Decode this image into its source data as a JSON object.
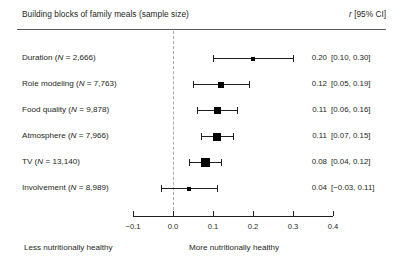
{
  "header": {
    "left_title": "Building blocks of family meals (sample size)",
    "right_title_stat": "r",
    "right_title_ci": " [95% CI]"
  },
  "chart_data": {
    "type": "forest",
    "title": "Building blocks of family meals (sample size)",
    "xlabel": "",
    "ylabel": "",
    "xlim": [
      -0.1,
      0.4
    ],
    "xticks": [
      "-0.1",
      "0.0",
      "0.1",
      "0.2",
      "0.3",
      "0.4"
    ],
    "xtick_values": [
      -0.1,
      0.0,
      0.1,
      0.2,
      0.3,
      0.4
    ],
    "grid": false,
    "reference_line": 0.0,
    "effect_measure": "r",
    "rows": [
      {
        "label_name": "Duration",
        "label_n": "2,666",
        "label": "Duration (N = 2,666)",
        "estimate": 0.2,
        "ci_low": 0.1,
        "ci_high": 0.3,
        "estimate_text": "0.20",
        "ci_text": "[0.10, 0.30]",
        "n": 2666,
        "marker_size": 4
      },
      {
        "label_name": "Role modeling",
        "label_n": "7,763",
        "label": "Role modeling (N = 7,763)",
        "estimate": 0.12,
        "ci_low": 0.05,
        "ci_high": 0.19,
        "estimate_text": "0.12",
        "ci_text": "[0.05, 0.19]",
        "n": 7763,
        "marker_size": 6
      },
      {
        "label_name": "Food quality",
        "label_n": "9,878",
        "label": "Food quality (N = 9,878)",
        "estimate": 0.11,
        "ci_low": 0.06,
        "ci_high": 0.16,
        "estimate_text": "0.11",
        "ci_text": "[0.06, 0.16]",
        "n": 9878,
        "marker_size": 7
      },
      {
        "label_name": "Atmosphere",
        "label_n": "7,966",
        "label": "Atmosphere (N = 7,966)",
        "estimate": 0.11,
        "ci_low": 0.07,
        "ci_high": 0.15,
        "estimate_text": "0.11",
        "ci_text": "[0.07, 0.15]",
        "n": 7966,
        "marker_size": 8
      },
      {
        "label_name": "TV",
        "label_n": "13,140",
        "label": "TV (N = 13,140)",
        "estimate": 0.08,
        "ci_low": 0.04,
        "ci_high": 0.12,
        "estimate_text": "0.08",
        "ci_text": "[0.04, 0.12]",
        "n": 13140,
        "marker_size": 9
      },
      {
        "label_name": "Involvement",
        "label_n": "8,989",
        "label": "Involvement (N = 8,989)",
        "estimate": 0.04,
        "ci_low": -0.03,
        "ci_high": 0.11,
        "estimate_text": "0.04",
        "ci_text": "[−0.03, 0.11]",
        "n": 8989,
        "marker_size": 4
      }
    ],
    "annotations": {
      "left_anchor": "Less nutritionally healthy",
      "right_anchor": "More nutritionally healthy"
    }
  },
  "colors": {
    "text": "#231f20",
    "rule": "#58595b",
    "zero_line": "#a7a9ac",
    "marker": "#000000"
  }
}
